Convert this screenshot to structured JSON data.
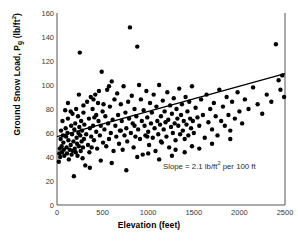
{
  "chart_data": {
    "type": "scatter",
    "title": "",
    "xlabel": "Elevation (feet)",
    "ylabel": "Ground Snow Load, Pg (lb/ft2)",
    "ylabel_parts": {
      "prefix": "Ground Snow Load, P",
      "sub": "g",
      "unit_open": " (lb/ft",
      "sup": "2",
      "unit_close": ")"
    },
    "xlim": [
      0,
      2500
    ],
    "ylim": [
      0,
      160
    ],
    "xticks": [
      0,
      500,
      1000,
      1500,
      2000,
      2500
    ],
    "yticks": [
      0,
      20,
      40,
      60,
      80,
      100,
      120,
      140,
      160
    ],
    "grid": false,
    "legend": "none",
    "marker": {
      "shape": "circle",
      "color": "#000000",
      "size": 2.2
    },
    "annotations": [
      {
        "name": "slope-annotation",
        "text": "Slope = 2.1 lb/ft2 per 100 ft",
        "text_parts": {
          "prefix": "Slope = 2.1 lb/ft",
          "sup": "2",
          "suffix": " per 100 ft"
        },
        "x": 950,
        "y": 28
      }
    ],
    "trendline": {
      "name": "regression-line",
      "slope_per_100ft": 2.1,
      "intercept": 57,
      "x_start": 0,
      "x_end": 2500,
      "y_start": 57,
      "y_end": 109.5,
      "color": "#000000",
      "width": 1.4
    },
    "points": [
      [
        20,
        36
      ],
      [
        25,
        43
      ],
      [
        30,
        47
      ],
      [
        35,
        40
      ],
      [
        40,
        55
      ],
      [
        45,
        62
      ],
      [
        50,
        49
      ],
      [
        55,
        44
      ],
      [
        60,
        70
      ],
      [
        65,
        58
      ],
      [
        70,
        52
      ],
      [
        75,
        46
      ],
      [
        80,
        41
      ],
      [
        90,
        79
      ],
      [
        95,
        64
      ],
      [
        100,
        57
      ],
      [
        105,
        48
      ],
      [
        110,
        43
      ],
      [
        115,
        60
      ],
      [
        120,
        72
      ],
      [
        125,
        54
      ],
      [
        130,
        38
      ],
      [
        140,
        46
      ],
      [
        150,
        50
      ],
      [
        155,
        66
      ],
      [
        160,
        42
      ],
      [
        165,
        59
      ],
      [
        170,
        76
      ],
      [
        175,
        45
      ],
      [
        180,
        53
      ],
      [
        185,
        24
      ],
      [
        190,
        63
      ],
      [
        195,
        47
      ],
      [
        200,
        68
      ],
      [
        205,
        44
      ],
      [
        210,
        80
      ],
      [
        215,
        56
      ],
      [
        220,
        51
      ],
      [
        225,
        41
      ],
      [
        230,
        74
      ],
      [
        235,
        60
      ],
      [
        240,
        49
      ],
      [
        245,
        65
      ],
      [
        250,
        127
      ],
      [
        255,
        58
      ],
      [
        260,
        45
      ],
      [
        265,
        70
      ],
      [
        270,
        53
      ],
      [
        275,
        62
      ],
      [
        280,
        39
      ],
      [
        285,
        48
      ],
      [
        290,
        77
      ],
      [
        295,
        55
      ],
      [
        300,
        67
      ],
      [
        310,
        33
      ],
      [
        320,
        59
      ],
      [
        330,
        86
      ],
      [
        340,
        50
      ],
      [
        350,
        72
      ],
      [
        355,
        44
      ],
      [
        360,
        64
      ],
      [
        370,
        90
      ],
      [
        375,
        57
      ],
      [
        380,
        48
      ],
      [
        390,
        80
      ],
      [
        395,
        66
      ],
      [
        400,
        88
      ],
      [
        405,
        54
      ],
      [
        410,
        73
      ],
      [
        420,
        92
      ],
      [
        430,
        61
      ],
      [
        440,
        47
      ],
      [
        450,
        85
      ],
      [
        455,
        70
      ],
      [
        460,
        95
      ],
      [
        470,
        58
      ],
      [
        480,
        66
      ],
      [
        490,
        111
      ],
      [
        500,
        78
      ],
      [
        505,
        52
      ],
      [
        510,
        84
      ],
      [
        520,
        63
      ],
      [
        530,
        74
      ],
      [
        540,
        49
      ],
      [
        550,
        96
      ],
      [
        560,
        68
      ],
      [
        570,
        55
      ],
      [
        580,
        82
      ],
      [
        590,
        60
      ],
      [
        600,
        103
      ],
      [
        610,
        71
      ],
      [
        620,
        45
      ],
      [
        630,
        88
      ],
      [
        640,
        66
      ],
      [
        650,
        57
      ],
      [
        660,
        93
      ],
      [
        670,
        75
      ],
      [
        680,
        51
      ],
      [
        690,
        62
      ],
      [
        700,
        84
      ],
      [
        710,
        70
      ],
      [
        720,
        46
      ],
      [
        730,
        99
      ],
      [
        740,
        58
      ],
      [
        750,
        77
      ],
      [
        760,
        64
      ],
      [
        770,
        53
      ],
      [
        780,
        86
      ],
      [
        790,
        72
      ],
      [
        800,
        148
      ],
      [
        810,
        60
      ],
      [
        820,
        91
      ],
      [
        830,
        68
      ],
      [
        840,
        48
      ],
      [
        850,
        80
      ],
      [
        860,
        57
      ],
      [
        870,
        74
      ],
      [
        880,
        132
      ],
      [
        890,
        63
      ],
      [
        900,
        100
      ],
      [
        910,
        55
      ],
      [
        920,
        88
      ],
      [
        930,
        70
      ],
      [
        940,
        42
      ],
      [
        950,
        79
      ],
      [
        960,
        66
      ],
      [
        970,
        58
      ],
      [
        980,
        95
      ],
      [
        990,
        73
      ],
      [
        1000,
        61
      ],
      [
        1010,
        50
      ],
      [
        1020,
        85
      ],
      [
        1030,
        68
      ],
      [
        1040,
        77
      ],
      [
        1050,
        56
      ],
      [
        1060,
        92
      ],
      [
        1070,
        64
      ],
      [
        1080,
        45
      ],
      [
        1090,
        82
      ],
      [
        1100,
        70
      ],
      [
        1110,
        59
      ],
      [
        1120,
        100
      ],
      [
        1130,
        67
      ],
      [
        1140,
        74
      ],
      [
        1150,
        52
      ],
      [
        1160,
        87
      ],
      [
        1170,
        63
      ],
      [
        1180,
        78
      ],
      [
        1190,
        69
      ],
      [
        1200,
        57
      ],
      [
        1210,
        94
      ],
      [
        1220,
        71
      ],
      [
        1230,
        48
      ],
      [
        1240,
        83
      ],
      [
        1250,
        65
      ],
      [
        1260,
        76
      ],
      [
        1270,
        60
      ],
      [
        1280,
        89
      ],
      [
        1290,
        68
      ],
      [
        1300,
        54
      ],
      [
        1310,
        80
      ],
      [
        1320,
        72
      ],
      [
        1330,
        66
      ],
      [
        1340,
        97
      ],
      [
        1350,
        59
      ],
      [
        1360,
        75
      ],
      [
        1370,
        84
      ],
      [
        1380,
        62
      ],
      [
        1390,
        70
      ],
      [
        1400,
        55
      ],
      [
        1410,
        90
      ],
      [
        1420,
        67
      ],
      [
        1430,
        78
      ],
      [
        1440,
        58
      ],
      [
        1450,
        86
      ],
      [
        1460,
        72
      ],
      [
        1470,
        64
      ],
      [
        1480,
        99
      ],
      [
        1490,
        70
      ],
      [
        1500,
        60
      ],
      [
        1520,
        81
      ],
      [
        1540,
        73
      ],
      [
        1560,
        66
      ],
      [
        1580,
        88
      ],
      [
        1600,
        75
      ],
      [
        1620,
        56
      ],
      [
        1640,
        92
      ],
      [
        1660,
        69
      ],
      [
        1680,
        80
      ],
      [
        1700,
        63
      ],
      [
        1720,
        85
      ],
      [
        1740,
        74
      ],
      [
        1760,
        58
      ],
      [
        1780,
        96
      ],
      [
        1800,
        70
      ],
      [
        1820,
        82
      ],
      [
        1840,
        66
      ],
      [
        1860,
        90
      ],
      [
        1880,
        75
      ],
      [
        1900,
        62
      ],
      [
        1920,
        86
      ],
      [
        1950,
        72
      ],
      [
        1980,
        94
      ],
      [
        2000,
        78
      ],
      [
        2030,
        68
      ],
      [
        2060,
        88
      ],
      [
        2100,
        80
      ],
      [
        2150,
        98
      ],
      [
        2200,
        84
      ],
      [
        2250,
        76
      ],
      [
        2300,
        92
      ],
      [
        2350,
        86
      ],
      [
        2400,
        134
      ],
      [
        2430,
        104
      ],
      [
        2450,
        96
      ],
      [
        2470,
        108
      ],
      [
        2490,
        90
      ],
      [
        120,
        85
      ],
      [
        240,
        92
      ],
      [
        360,
        31
      ],
      [
        480,
        37
      ],
      [
        600,
        35
      ],
      [
        760,
        29
      ],
      [
        880,
        40
      ],
      [
        1000,
        43
      ],
      [
        1120,
        38
      ],
      [
        1260,
        41
      ],
      [
        1400,
        44
      ],
      [
        1560,
        47
      ],
      [
        150,
        78
      ],
      [
        290,
        83
      ],
      [
        430,
        75
      ],
      [
        570,
        99
      ],
      [
        700,
        62
      ],
      [
        850,
        66
      ],
      [
        990,
        57
      ],
      [
        1140,
        53
      ],
      [
        1300,
        46
      ],
      [
        1480,
        49
      ],
      [
        1700,
        51
      ],
      [
        1900,
        55
      ]
    ]
  }
}
